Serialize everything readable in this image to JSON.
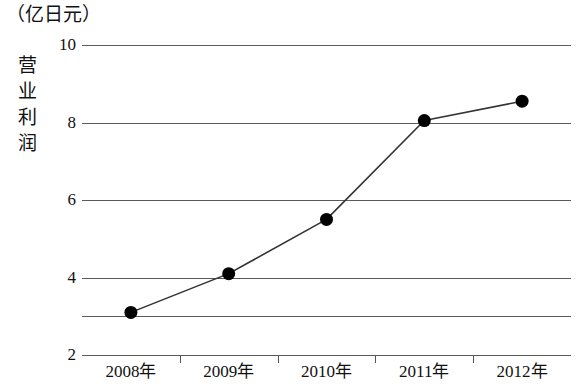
{
  "chart_data": {
    "type": "line",
    "title": "（亿日元）",
    "ylabel": "营业利润",
    "xlabel": "",
    "categories": [
      "2008年",
      "2009年",
      "2010年",
      "2011年",
      "2012年"
    ],
    "x": [
      2008,
      2009,
      2010,
      2011,
      2012
    ],
    "values": [
      3.1,
      4.1,
      5.5,
      8.05,
      8.55
    ],
    "series": [
      {
        "name": "营业利润",
        "values": [
          3.1,
          4.1,
          5.5,
          8.05,
          8.55
        ]
      }
    ],
    "ylim": [
      2,
      10
    ],
    "y_ticks": [
      2,
      4,
      6,
      8,
      10
    ],
    "y_tick_labels": [
      "2",
      "4",
      "6",
      "8",
      "10"
    ],
    "gridlines": [
      2,
      3,
      4,
      6,
      8,
      10
    ],
    "grid": true,
    "legend": "none",
    "marker": "filled-circle",
    "line_color": "#333333",
    "marker_color": "#000000",
    "grid_color": "#5a5a5a",
    "background_color": "#ffffff"
  },
  "axis": {
    "unit_title": "（亿日元）",
    "y_title_chars": [
      "营",
      "业",
      "利",
      "润"
    ]
  }
}
